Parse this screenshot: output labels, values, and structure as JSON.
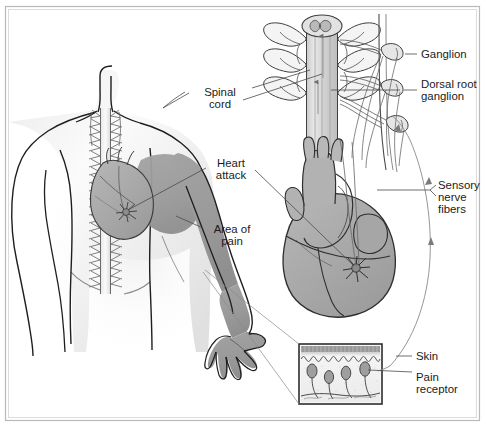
{
  "figure": {
    "background_color": "#fdfdfd",
    "border_color": "#b9b9b9",
    "ink_color": "#1e1e1e",
    "shade_color": "#9b9b9b",
    "light_shade_color": "#d7d7d7"
  },
  "labels": {
    "spinal_cord": {
      "line1": "Spinal",
      "line2": "cord"
    },
    "heart_attack": {
      "line1": "Heart",
      "line2": "attack"
    },
    "area_of_pain": {
      "line1": "Area of",
      "line2": "pain"
    },
    "ganglion": {
      "line1": "Ganglion"
    },
    "dorsal_root_ganglion": {
      "line1": "Dorsal root",
      "line2": "ganglion"
    },
    "sensory_nerve_fibers": {
      "line1": "Sensory",
      "line2": "nerve",
      "line3": "fibers"
    },
    "skin": {
      "line1": "Skin"
    },
    "pain_receptor": {
      "line1": "Pain",
      "line2": "receptor"
    }
  },
  "parts": {
    "torso": "human-torso-front",
    "spine": "vertebral-column",
    "heart_body": "heart-in-chest",
    "spinal_cord_detail": "spinal-cord-cross-section",
    "heart_detail": "heart-anterior-view",
    "skin_inset": "skin-cross-section",
    "pain_starburst": "pain-starburst",
    "nerve_arc": "sensory-nerve-arc"
  }
}
